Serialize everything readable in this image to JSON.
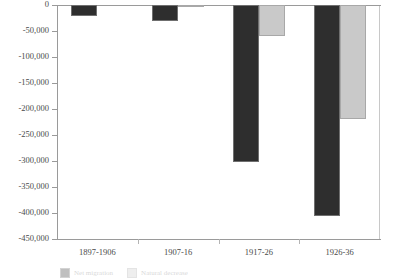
{
  "chart_data": {
    "type": "bar",
    "title": "",
    "subtitle": "",
    "xlabel": "",
    "ylabel": "",
    "categories": [
      "1897-1906",
      "1907-16",
      "1917-26",
      "1926-36"
    ],
    "series": [
      {
        "name": "Net migration",
        "color": "#2e2e2e",
        "values": [
          -22000,
          -30000,
          -302000,
          -406000
        ]
      },
      {
        "name": "Natural decrease",
        "color": "#c9c9c9",
        "values": [
          0,
          -4000,
          -60000,
          -220000
        ]
      }
    ],
    "ylim": [
      -450000,
      0
    ],
    "ytick_labels": [
      "0",
      "-50,000",
      "-100,000",
      "-150,000",
      "-200,000",
      "-250,000",
      "-300,000",
      "-350,000",
      "-400,000",
      "-450,000"
    ],
    "ytick_values": [
      0,
      -50000,
      -100000,
      -150000,
      -200000,
      -250000,
      -300000,
      -350000,
      -400000,
      -450000
    ],
    "grid": false,
    "legend_position": "bottom-left"
  },
  "colors": {
    "series_dark": "#2e2e2e",
    "series_light": "#c9c9c9",
    "axis": "#9a9a9a",
    "text": "#4a4a4a",
    "background": "#ffffff"
  }
}
